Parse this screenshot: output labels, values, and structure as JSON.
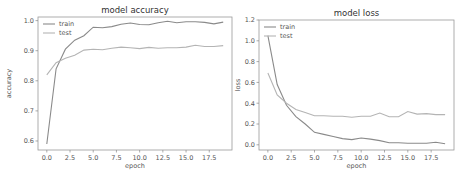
{
  "chart_data": [
    {
      "type": "line",
      "title": "model accuracy",
      "xlabel": "epoch",
      "ylabel": "accuracy",
      "xlim": [
        -0.95,
        19.95
      ],
      "ylim": [
        0.57,
        1.012
      ],
      "xticks": [
        0.0,
        2.5,
        5.0,
        7.5,
        10.0,
        12.5,
        15.0,
        17.5
      ],
      "xtick_labels": [
        "0.0",
        "2.5",
        "5.0",
        "7.5",
        "10.0",
        "12.5",
        "15.0",
        "17.5"
      ],
      "yticks": [
        0.6,
        0.7,
        0.8,
        0.9,
        1.0
      ],
      "ytick_labels": [
        "0.6",
        "0.7",
        "0.8",
        "0.9",
        "1.0"
      ],
      "legend": {
        "position": "upper left",
        "entries": [
          "train",
          "test"
        ]
      },
      "grid": false,
      "x": [
        0,
        1,
        2,
        3,
        4,
        5,
        6,
        7,
        8,
        9,
        10,
        11,
        12,
        13,
        14,
        15,
        16,
        17,
        18,
        19
      ],
      "series": [
        {
          "name": "train",
          "color": "#8a8a8a",
          "values": [
            0.59,
            0.84,
            0.905,
            0.935,
            0.95,
            0.978,
            0.976,
            0.98,
            0.988,
            0.992,
            0.987,
            0.986,
            0.993,
            0.998,
            0.993,
            0.996,
            0.996,
            0.994,
            0.989,
            0.995
          ]
        },
        {
          "name": "test",
          "color": "#b4b4b4",
          "values": [
            0.82,
            0.86,
            0.875,
            0.885,
            0.902,
            0.905,
            0.903,
            0.908,
            0.912,
            0.91,
            0.907,
            0.911,
            0.908,
            0.91,
            0.91,
            0.912,
            0.918,
            0.914,
            0.914,
            0.917
          ]
        }
      ]
    },
    {
      "type": "line",
      "title": "model loss",
      "xlabel": "epoch",
      "ylabel": "loss",
      "xlim": [
        -0.95,
        19.95
      ],
      "ylim": [
        -0.05,
        1.2
      ],
      "xticks": [
        0.0,
        2.5,
        5.0,
        7.5,
        10.0,
        12.5,
        15.0,
        17.5
      ],
      "xtick_labels": [
        "0.0",
        "2.5",
        "5.0",
        "7.5",
        "10.0",
        "12.5",
        "15.0",
        "17.5"
      ],
      "yticks": [
        0.0,
        0.2,
        0.4,
        0.6,
        0.8,
        1.0,
        1.2
      ],
      "ytick_labels": [
        "0.0",
        "0.2",
        "0.4",
        "0.6",
        "0.8",
        "1.0",
        "1.2"
      ],
      "legend": {
        "position": "upper left",
        "entries": [
          "train",
          "test"
        ]
      },
      "grid": false,
      "x": [
        0,
        1,
        2,
        3,
        4,
        5,
        6,
        7,
        8,
        9,
        10,
        11,
        12,
        13,
        14,
        15,
        16,
        17,
        18,
        19
      ],
      "series": [
        {
          "name": "train",
          "color": "#8a8a8a",
          "values": [
            1.05,
            0.58,
            0.38,
            0.27,
            0.2,
            0.12,
            0.1,
            0.08,
            0.06,
            0.05,
            0.065,
            0.055,
            0.04,
            0.02,
            0.02,
            0.015,
            0.015,
            0.015,
            0.025,
            0.01
          ]
        },
        {
          "name": "test",
          "color": "#b4b4b4",
          "values": [
            0.69,
            0.48,
            0.4,
            0.34,
            0.31,
            0.28,
            0.28,
            0.275,
            0.275,
            0.265,
            0.275,
            0.275,
            0.305,
            0.27,
            0.27,
            0.32,
            0.295,
            0.3,
            0.29,
            0.29
          ]
        }
      ]
    }
  ]
}
